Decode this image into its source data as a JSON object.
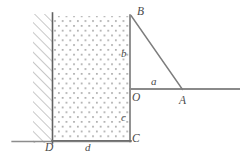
{
  "figure": {
    "type": "geometry-diagram",
    "colors": {
      "stroke": "#6e6e6e",
      "stroke_dark": "#5a5a5a",
      "hatch": "#9a9a9a",
      "dot_fill": "#9a9a9a",
      "label": "#4a4a4a",
      "background": "#ffffff"
    },
    "points": [
      {
        "id": "B",
        "label": "B",
        "x": 137,
        "y": 13,
        "kind": "vertex"
      },
      {
        "id": "O",
        "label": "O",
        "x": 133,
        "y": 99,
        "kind": "vertex"
      },
      {
        "id": "A",
        "label": "A",
        "x": 180,
        "y": 103,
        "kind": "vertex"
      },
      {
        "id": "C",
        "label": "C",
        "x": 133,
        "y": 142,
        "kind": "vertex"
      },
      {
        "id": "D",
        "label": "D",
        "x": 47,
        "y": 146,
        "kind": "vertex"
      }
    ],
    "dimensions": [
      {
        "id": "b",
        "label": "b",
        "x": 122,
        "y": 50,
        "measures": "vertical segment B to O"
      },
      {
        "id": "a",
        "label": "a",
        "x": 152,
        "y": 80,
        "measures": "horizontal segment O to A"
      },
      {
        "id": "c",
        "label": "c",
        "x": 122,
        "y": 118,
        "measures": "vertical segment O to C"
      },
      {
        "id": "d",
        "label": "d",
        "x": 86,
        "y": 146,
        "measures": "horizontal segment D to C"
      }
    ],
    "segments": [
      {
        "id": "wall-line",
        "from": [
          52,
          14
        ],
        "to": [
          52,
          143
        ],
        "style": "solid"
      },
      {
        "id": "block-right-edge",
        "from": [
          130,
          16
        ],
        "to": [
          130,
          141
        ],
        "style": "solid"
      },
      {
        "id": "block-bottom",
        "from": [
          52,
          141
        ],
        "to": [
          131,
          141
        ],
        "style": "solid"
      },
      {
        "id": "ground-line",
        "from": [
          12,
          141
        ],
        "to": [
          131,
          141
        ],
        "style": "solid"
      },
      {
        "id": "horizontal-OA",
        "from": [
          130,
          89
        ],
        "to": [
          240,
          89
        ],
        "style": "solid"
      },
      {
        "id": "diagonal-BA",
        "from": [
          131,
          16
        ],
        "to": [
          182,
          89
        ],
        "style": "solid"
      }
    ],
    "regions": [
      {
        "id": "hatched-wall",
        "x": 33,
        "y": 14,
        "width": 19,
        "height": 129,
        "fill": "diagonal-hatch"
      },
      {
        "id": "stippled-block",
        "x": 53,
        "y": 16,
        "width": 77,
        "height": 125,
        "fill": "dot-stipple"
      }
    ]
  }
}
